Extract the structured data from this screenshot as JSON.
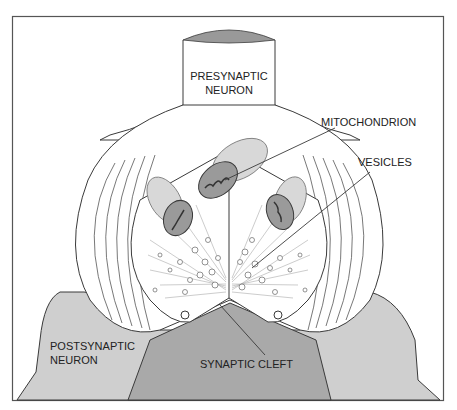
{
  "diagram": {
    "labels": {
      "presynaptic_line1": "PRESYNAPTIC",
      "presynaptic_line2": "NEURON",
      "mitochondrion": "MITOCHONDRION",
      "vesicles": "VESICLES",
      "postsynaptic_line1": "POSTSYNAPTIC",
      "postsynaptic_line2": "NEURON",
      "synaptic_cleft": "SYNAPTIC CLEFT"
    },
    "colors": {
      "outline": "#3a3a3a",
      "postsynaptic_light": "#cfcfcf",
      "postsynaptic_dark": "#a9a9a9",
      "mito_outer": "#d8d8d8",
      "mito_inner": "#9a9a9a",
      "cut_top": "#999999",
      "background": "#ffffff"
    }
  }
}
